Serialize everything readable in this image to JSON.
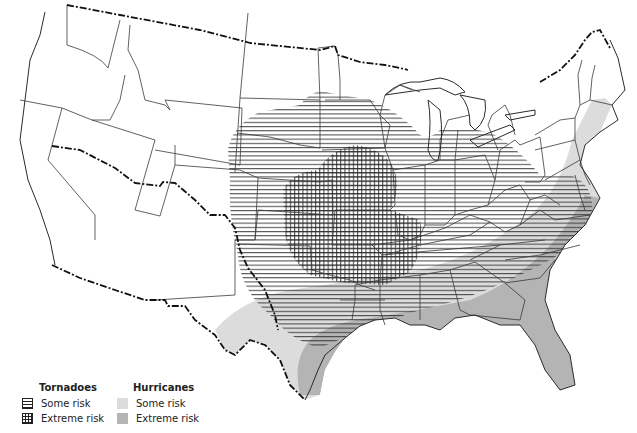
{
  "map": {
    "subject": "Contiguous United States — tornado and hurricane risk zones",
    "colors": {
      "background": "#ffffff",
      "state_lines": "#3a3a3a",
      "international_border": "#111111",
      "tornado_hatch": "#2a2a2a",
      "hurricane_some": "#dcdcdc",
      "hurricane_extreme": "#b4b4b4"
    }
  },
  "legend": {
    "tornadoes": {
      "title": "Tornadoes",
      "items": [
        {
          "label": "Some risk",
          "pattern": "horizontal-hatch"
        },
        {
          "label": "Extreme risk",
          "pattern": "cross-hatch"
        }
      ]
    },
    "hurricanes": {
      "title": "Hurricanes",
      "items": [
        {
          "label": "Some risk",
          "color": "#dcdcdc"
        },
        {
          "label": "Extreme risk",
          "color": "#b4b4b4"
        }
      ]
    }
  }
}
